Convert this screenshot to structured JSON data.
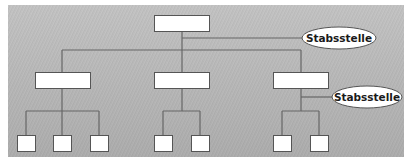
{
  "diagram": {
    "type": "org-chart",
    "top_box": {
      "label": ""
    },
    "staff_positions": [
      {
        "label": "Stabsstelle",
        "attached_to": "top_box"
      },
      {
        "label": "Stabsstelle",
        "attached_to": "level2_box_3"
      }
    ],
    "level2_boxes": [
      {
        "label": ""
      },
      {
        "label": ""
      },
      {
        "label": ""
      }
    ],
    "level3_groups": [
      {
        "parent": "level2_box_1",
        "count": 3
      },
      {
        "parent": "level2_box_2",
        "count": 2
      },
      {
        "parent": "level2_box_3",
        "count": 2
      }
    ],
    "colors": {
      "line": "#666666",
      "box_fill": "#ffffff",
      "box_stroke": "#555555",
      "background": "#d4d4d4"
    }
  }
}
